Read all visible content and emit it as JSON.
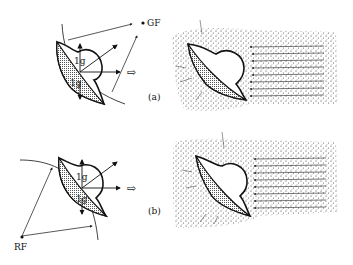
{
  "figure": {
    "panels": [
      {
        "id": "a",
        "label": "(a)",
        "reference_label": "GF",
        "force_labels": [
          "1g",
          "1g"
        ],
        "flow_arrow": "⇨"
      },
      {
        "id": "b",
        "label": "(b)",
        "reference_label": "RF",
        "force_labels": [
          "1g",
          "1g"
        ],
        "flow_arrow": "⇨"
      }
    ]
  },
  "colors": {
    "ink": "#111111",
    "background": "#ffffff",
    "stipple": "#333333"
  }
}
